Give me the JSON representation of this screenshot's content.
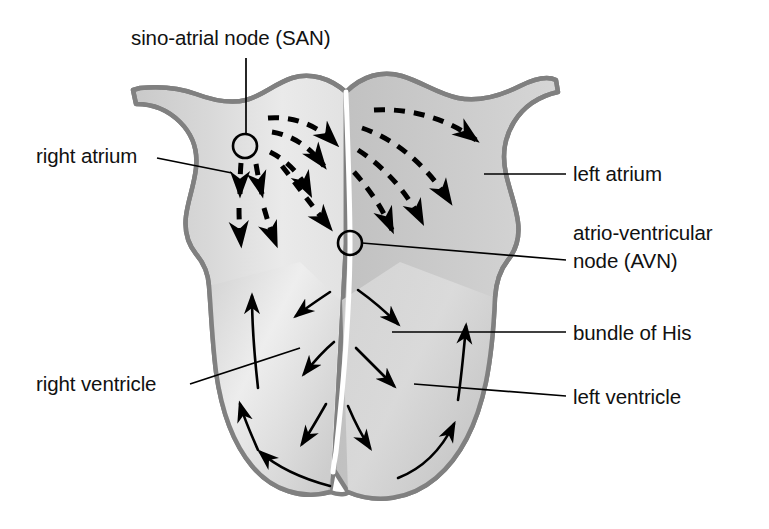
{
  "figure": {
    "type": "anatomical-diagram",
    "colors": {
      "outline": "#808080",
      "atrium_fill_light": "#e6e6e6",
      "atrium_fill_dark": "#c2c2c2",
      "ventricle_fill_light": "#ececec",
      "ventricle_fill_dark": "#c6c6c6",
      "septum": "#ffffff",
      "arrow": "#000000",
      "label_text": "#111111",
      "leader_line": "#000000",
      "background": "#ffffff"
    }
  },
  "labels": {
    "san": "sino-atrial node (SAN)",
    "right_atrium": "right atrium",
    "left_atrium": "left atrium",
    "avn_line1": "atrio-ventricular",
    "avn_line2": "node (AVN)",
    "bundle_of_his": "bundle of His",
    "right_ventricle": "right ventricle",
    "left_ventricle": "left ventricle"
  },
  "nodes": [
    {
      "name": "sino-atrial node",
      "abbr": "SAN",
      "cx": 245,
      "cy": 146,
      "r": 12
    },
    {
      "name": "atrio-ventricular node",
      "abbr": "AVN",
      "cx": 350,
      "cy": 243,
      "r": 12
    }
  ],
  "conduction": {
    "atrial_pathways": "dashed arrows spreading from SAN across both atria toward AVN",
    "ventricular_pathways": "solid arrows spreading from AVN down the septum and up the ventricle walls"
  }
}
